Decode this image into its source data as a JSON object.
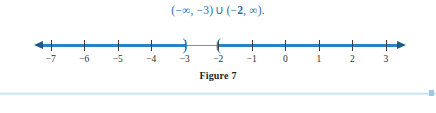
{
  "interval_notation": {
    "open_paren_1": "(",
    "neg_infinity": "−∞",
    "comma_1": ",",
    "neg_three": "−3",
    "close_paren_1": ")",
    "union_symbol": "∪",
    "open_paren_2": "(",
    "neg_sign_2": "−",
    "two": "2",
    "comma_2": ",",
    "pos_infinity": "∞",
    "close_paren_2": ")",
    "period": ".",
    "full_text": "(−∞, −3) ∪ (−2, ∞).",
    "color": "#2a6fb0"
  },
  "number_line": {
    "tick_values": [
      -7,
      -6,
      -5,
      -4,
      -3,
      -2,
      -1,
      0,
      1,
      2,
      3
    ],
    "tick_labels": [
      "−7",
      "−6",
      "−5",
      "−4",
      "−3",
      "−2",
      "−1",
      "0",
      "1",
      "2",
      "3"
    ],
    "axis_min": -7.5,
    "axis_max": 3.6,
    "shaded_color": "#2a83c4",
    "unshaded_color": "#8d8d8d",
    "arrow_color": "#1b5e8a",
    "left_arrow": "arrow-left",
    "right_arrow": "arrow-right",
    "endpoints": [
      {
        "value": -3,
        "glyph": ")",
        "type": "open"
      },
      {
        "value": -2,
        "glyph": "(",
        "type": "open"
      }
    ],
    "shaded_rays": [
      {
        "from": "-infinity",
        "to": -3,
        "direction": "left"
      },
      {
        "from": -2,
        "to": "+infinity",
        "direction": "right"
      }
    ]
  },
  "caption": {
    "text": "Figure 7"
  },
  "rule": {
    "color": "#bcdcf0",
    "marker_color": "#9dc9e6"
  }
}
